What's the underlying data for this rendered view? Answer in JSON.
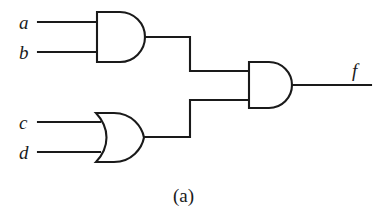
{
  "figure": {
    "caption": "(a)",
    "type": "logic-circuit-schematic",
    "background_color": "#ffffff",
    "line_color": "#1a1a1a"
  },
  "signals": {
    "input_a": "a",
    "input_b": "b",
    "input_c": "c",
    "input_d": "d",
    "output_f": "f"
  },
  "gates": [
    {
      "id": "and1",
      "kind": "AND",
      "symbol_name": "and-gate",
      "inputs": [
        "a",
        "b"
      ],
      "output": "ab"
    },
    {
      "id": "or1",
      "kind": "OR",
      "symbol_name": "or-gate",
      "inputs": [
        "c",
        "d"
      ],
      "output": "cd"
    },
    {
      "id": "and2",
      "kind": "AND",
      "symbol_name": "and-gate",
      "inputs": [
        "ab",
        "cd"
      ],
      "output": "f"
    }
  ],
  "geometry": {
    "and1": {
      "x": 96,
      "y": 12,
      "w": 49,
      "h": 50
    },
    "or1": {
      "x": 96,
      "y": 113,
      "w": 48,
      "h": 49
    },
    "and2": {
      "x": 248,
      "y": 62,
      "w": 44,
      "h": 46
    },
    "input_wire_x_start": 38,
    "and1_in_y": [
      22,
      52
    ],
    "or1_in_y": [
      122,
      152
    ],
    "and2_in_y": [
      71,
      100
    ],
    "riser_x": 190,
    "output_wire_x_end": 371,
    "output_wire_y": 85
  }
}
